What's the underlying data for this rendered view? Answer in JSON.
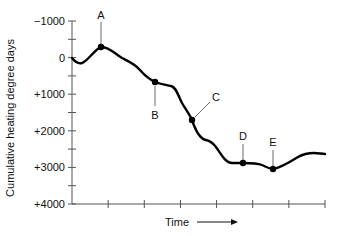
{
  "chart_data": {
    "type": "line",
    "title": "",
    "xlabel": "Time",
    "ylabel": "Cumulative heating degree days",
    "ylim": [
      -1000,
      4000
    ],
    "y_inverted": true,
    "y_ticks": [
      {
        "value": -1000,
        "label": "−1000"
      },
      {
        "value": 0,
        "label": "0"
      },
      {
        "value": 1000,
        "label": "+1000"
      },
      {
        "value": 2000,
        "label": "+2000"
      },
      {
        "value": 3000,
        "label": "+3000"
      },
      {
        "value": 4000,
        "label": "+4000"
      }
    ],
    "y_minor_step": 500,
    "x_tick_count": 8,
    "x_arrow": true,
    "grid": false,
    "legend": null,
    "series": [
      {
        "name": "Cumulative heating degree days",
        "x": [
          0,
          0.2,
          0.8,
          1.5,
          2.4,
          2.9,
          3.5,
          3.9,
          4.1,
          4.6,
          5.0,
          5.5,
          6.2,
          6.6,
          7.2,
          7.6,
          8.0
        ],
        "values": [
          0,
          150,
          -300,
          250,
          650,
          800,
          1700,
          2200,
          2300,
          2850,
          2850,
          2850,
          3000,
          2900,
          2650,
          2620,
          2620
        ]
      }
    ],
    "annotations": [
      {
        "label": "A",
        "x": 0.8,
        "value": -300,
        "leader": "up"
      },
      {
        "label": "B",
        "x": 2.3,
        "value": 650,
        "leader": "down"
      },
      {
        "label": "C",
        "x": 3.3,
        "value": 1700,
        "leader": "diagonal-up-right"
      },
      {
        "label": "D",
        "x": 4.7,
        "value": 2850,
        "leader": "up"
      },
      {
        "label": "E",
        "x": 5.5,
        "value": 3000,
        "leader": "up"
      }
    ]
  },
  "labels": {
    "time": "Time",
    "ylabel": "Cumulative heating degree days"
  }
}
